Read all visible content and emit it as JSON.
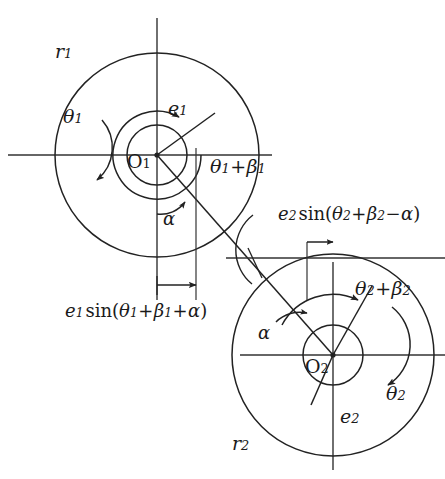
{
  "figure": {
    "type": "diagram",
    "stroke_color": "#222222",
    "background_color": "#ffffff",
    "axis_color": "#333333"
  },
  "rotors": [
    {
      "id": "rotor-1",
      "center_label": "O",
      "center_sub": "1",
      "center_px": [
        157,
        155
      ],
      "outer_radius_label": "r",
      "outer_radius_sub": "1",
      "outer_radius_px": 102,
      "inner_radius_px": 30,
      "eccentricity_label": "e",
      "eccentricity_sub": "1",
      "rotation_label": "θ",
      "rotation_sub": "1",
      "angle_label_main": "θ",
      "angle_label_sub1": "1",
      "angle_label_op": "+",
      "angle_label_beta": "β",
      "angle_label_sub2": "1"
    },
    {
      "id": "rotor-2",
      "center_label": "O",
      "center_sub": "2",
      "center_px": [
        333,
        355
      ],
      "outer_radius_label": "r",
      "outer_radius_sub": "2",
      "outer_radius_px": 101,
      "inner_radius_px": 30,
      "eccentricity_label": "e",
      "eccentricity_sub": "2",
      "rotation_label": "θ",
      "rotation_sub": "2",
      "angle_label_main": "θ",
      "angle_label_sub1": "2",
      "angle_label_op": "+",
      "angle_label_beta": "β",
      "angle_label_sub2": "2"
    }
  ],
  "angles": {
    "alpha_upper": "α",
    "alpha_lower": "α"
  },
  "formulas": {
    "left": {
      "e": "e",
      "e_sub": "1",
      "fn": "sin",
      "open": "(",
      "theta": "θ",
      "theta_sub": "1",
      "op1": "+",
      "beta": "β",
      "beta_sub": "1",
      "op2": "+",
      "alpha": "α",
      "close": ")",
      "plain": "e1 sin(θ1+β1+α)"
    },
    "right": {
      "e": "e",
      "e_sub": "2",
      "fn": "sin",
      "open": "(",
      "theta": "θ",
      "theta_sub": "2",
      "op1": "+",
      "beta": "β",
      "beta_sub": "2",
      "op2": "−",
      "alpha": "α",
      "close": ")",
      "plain": "e2 sin(θ2+β2−α)"
    }
  }
}
